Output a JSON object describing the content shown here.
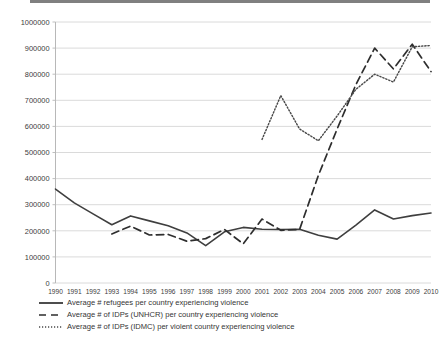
{
  "chart_data": {
    "type": "line",
    "title": "",
    "xlabel": "",
    "ylabel": "",
    "grid": true,
    "legend_position": "bottom-left",
    "ylim": [
      0,
      1000000
    ],
    "ytick_step": 100000,
    "yticks": [
      "0",
      "100000",
      "200000",
      "300000",
      "400000",
      "500000",
      "600000",
      "700000",
      "800000",
      "900000",
      "1000000"
    ],
    "categories": [
      "1990",
      "1991",
      "1992",
      "1993",
      "1994",
      "1995",
      "1996",
      "1997",
      "1998",
      "1999",
      "2000",
      "2001",
      "2002",
      "2003",
      "2004",
      "2005",
      "2006",
      "2007",
      "2008",
      "2009",
      "2010"
    ],
    "series": [
      {
        "name": "Average # refugees per country experiencing violence",
        "style": "solid",
        "color": "#3f3f3f",
        "values": [
          360000,
          307000,
          265000,
          223000,
          257000,
          238000,
          219000,
          192000,
          143000,
          196000,
          213000,
          206000,
          205000,
          206000,
          183000,
          168000,
          222000,
          280000,
          245000,
          258000,
          268000
        ]
      },
      {
        "name": "Average # of IDPs (UNHCR) per country experiencing violence",
        "style": "dashed",
        "color": "#2e2e2e",
        "values": [
          null,
          null,
          null,
          188000,
          218000,
          184000,
          186000,
          160000,
          170000,
          205000,
          150000,
          245000,
          202000,
          205000,
          412000,
          590000,
          760000,
          900000,
          820000,
          915000,
          810000
        ]
      },
      {
        "name": "Average # of IDPs (IDMC) per violent country experiencing violence",
        "style": "dotted",
        "color": "#4a4a4a",
        "values": [
          null,
          null,
          null,
          null,
          null,
          null,
          null,
          null,
          null,
          null,
          null,
          550000,
          718000,
          590000,
          545000,
          640000,
          742000,
          800000,
          770000,
          905000,
          910000
        ]
      }
    ]
  },
  "legend": {
    "items": [
      {
        "label": "Average # refugees per country experiencing violence",
        "style": "solid"
      },
      {
        "label": "Average # of IDPs (UNHCR) per country experiencing violence",
        "style": "dashed"
      },
      {
        "label": "Average # of IDPs (IDMC) per violent country experiencing violence",
        "style": "dotted"
      }
    ]
  }
}
